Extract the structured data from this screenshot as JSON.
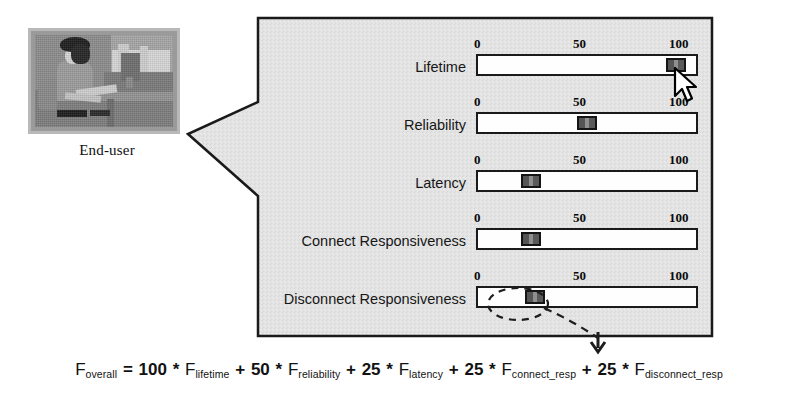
{
  "enduser": {
    "caption": "End-user",
    "photo_alt": "end-user-photo"
  },
  "panel": {
    "scale_ticks": [
      "0",
      "50",
      "100"
    ],
    "sliders": [
      {
        "label": "Lifetime",
        "value": 96,
        "thumb_name": "slider-thumb-lifetime"
      },
      {
        "label": "Reliability",
        "value": 50,
        "thumb_name": "slider-thumb-reliability"
      },
      {
        "label": "Latency",
        "value": 21,
        "thumb_name": "slider-thumb-latency"
      },
      {
        "label": "Connect Responsiveness",
        "value": 21,
        "thumb_name": "slider-thumb-connect-responsiveness"
      },
      {
        "label": "Disconnect Responsiveness",
        "value": 23,
        "thumb_name": "slider-thumb-disconnect-responsiveness"
      }
    ]
  },
  "formula": {
    "lhs_f": "F",
    "lhs_sub": "overall",
    "equals": "=",
    "terms": [
      {
        "coefficient": "100",
        "f": "F",
        "sub": "lifetime"
      },
      {
        "coefficient": "50",
        "f": "F",
        "sub": "reliability"
      },
      {
        "coefficient": "25",
        "f": "F",
        "sub": "latency"
      },
      {
        "coefficient": "25",
        "f": "F",
        "sub": "connect_resp"
      },
      {
        "coefficient": "25",
        "f": "F",
        "sub": "disconnect_resp"
      }
    ],
    "multiply": "*",
    "plus": "+"
  },
  "colors": {
    "panel_fill": "#e2e2e2",
    "panel_stroke": "#1a1a1a",
    "track_fill": "#fefefe",
    "thumb_fill": "#6b6b6b",
    "text": "#121212"
  }
}
